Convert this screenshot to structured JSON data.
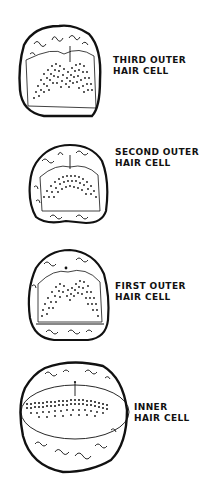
{
  "figure": {
    "type": "diagram",
    "colors": {
      "ink": "#111111",
      "background": "#ffffff"
    },
    "panels": [
      {
        "id": "third-outer",
        "label_line1": "THIRD OUTER",
        "label_line2": "HAIR CELL",
        "bundle_shape": "W/V-shaped dense array"
      },
      {
        "id": "second-outer",
        "label_line1": "SECOND OUTER",
        "label_line2": "HAIR CELL",
        "bundle_shape": "shallow V-shaped array"
      },
      {
        "id": "first-outer",
        "label_line1": "FIRST OUTER",
        "label_line2": "HAIR CELL",
        "bundle_shape": "W-shaped array"
      },
      {
        "id": "inner",
        "label_line1": "INNER",
        "label_line2": "HAIR CELL",
        "bundle_shape": "nearly linear rows"
      }
    ]
  }
}
